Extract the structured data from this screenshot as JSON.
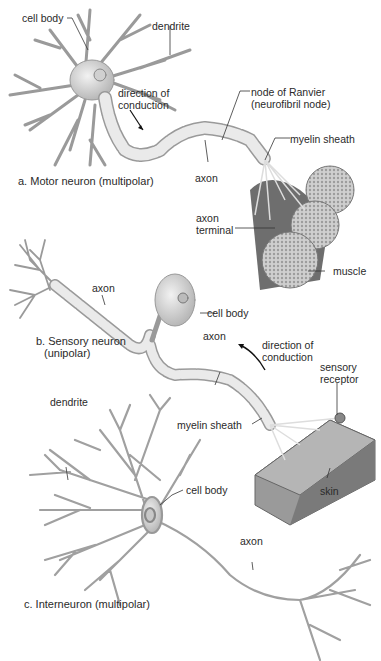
{
  "panels": {
    "motor": {
      "title": "a. Motor neuron (multipolar)",
      "labels": {
        "cell_body": "cell body",
        "dendrite": "dendrite",
        "direction_1": "direction of",
        "direction_2": "conduction",
        "node_1": "node of Ranvier",
        "node_2": "(neurofibril node)",
        "myelin": "myelin sheath",
        "axon": "axon",
        "axon_terminal_1": "axon",
        "axon_terminal_2": "terminal",
        "muscle": "muscle"
      }
    },
    "sensory": {
      "title_1": "b. Sensory neuron",
      "title_2": "(unipolar)",
      "labels": {
        "axon_left": "axon",
        "cell_body": "cell body",
        "axon_right": "axon",
        "direction_1": "direction of",
        "direction_2": "conduction",
        "receptor_1": "sensory",
        "receptor_2": "receptor",
        "myelin": "myelin sheath",
        "skin": "skin"
      }
    },
    "interneuron": {
      "title": "c.  Interneuron (multipolar)",
      "labels": {
        "dendrite": "dendrite",
        "cell_body": "cell body",
        "axon": "axon"
      }
    }
  },
  "colors": {
    "neuron_fill": "#e6e6e6",
    "neuron_stroke": "#9a9a9a",
    "muscle": "#6e6e6e",
    "skin": "#8a8a8a",
    "leader": "#333333"
  }
}
